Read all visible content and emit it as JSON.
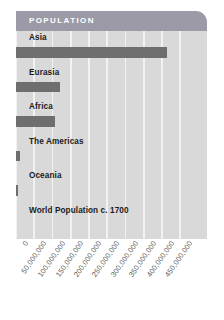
{
  "header": {
    "title": "POPULATION"
  },
  "chart_data": {
    "type": "bar",
    "orientation": "horizontal",
    "title": "POPULATION",
    "caption": "World Population c. 1700",
    "xlabel": "",
    "ylabel": "",
    "xlim": [
      0,
      470000000
    ],
    "grid": true,
    "legend": false,
    "categories": [
      "Asia",
      "Eurasia",
      "Africa",
      "The Americas",
      "Oceania",
      "World Population c. 1700"
    ],
    "values": [
      415000000,
      120000000,
      107000000,
      12000000,
      3000000,
      null
    ],
    "tick_labels": [
      "0",
      "50,000,000",
      "100,000,000",
      "150,000,000",
      "200,000,000",
      "250,000,000",
      "300,000,000",
      "350,000,000",
      "400,000,000",
      "450,000,000"
    ],
    "tick_values": [
      0,
      50000000,
      100000000,
      150000000,
      200000000,
      250000000,
      300000000,
      350000000,
      400000000,
      450000000
    ],
    "rows": [
      {
        "label": "Asia",
        "value": 415000000,
        "has_bar": true
      },
      {
        "label": "Eurasia",
        "value": 120000000,
        "has_bar": true
      },
      {
        "label": "Africa",
        "value": 107000000,
        "has_bar": true
      },
      {
        "label": "The Americas",
        "value": 12000000,
        "has_bar": true
      },
      {
        "label": "Oceania",
        "value": 3000000,
        "has_bar": true
      },
      {
        "label": "World Population c. 1700",
        "value": null,
        "has_bar": false
      }
    ]
  },
  "colors": {
    "panel_background": "#d9d9d9",
    "header_background": "#9b9aa6",
    "header_text": "#ffffff",
    "bar": "#6e6e6e",
    "gridline": "#f2f2f2",
    "label_text": "#1b1b1b",
    "tick_text": "#5d5d5d",
    "page_background": "#ffffff"
  }
}
